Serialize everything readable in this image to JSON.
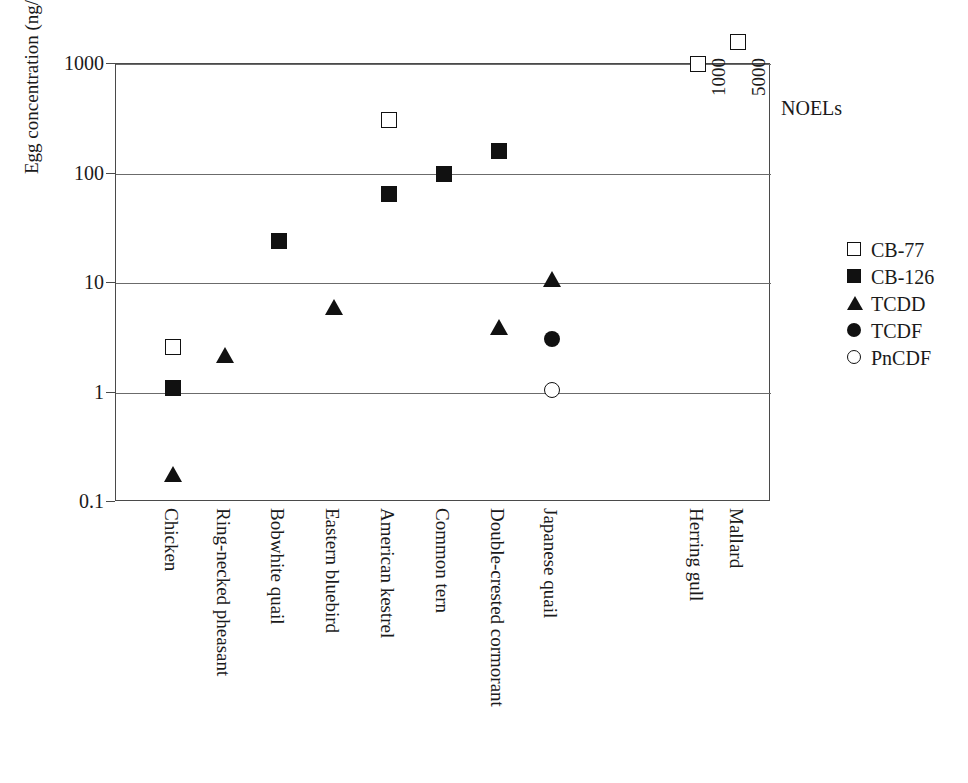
{
  "chart_data": {
    "type": "scatter",
    "title": "",
    "xlabel": "",
    "ylabel": "Egg concentration (ng/g ww)",
    "yscale": "log",
    "ylim": [
      0.1,
      1000
    ],
    "ytick_labels": [
      "1000",
      "100",
      "10",
      "1",
      "0.1"
    ],
    "ytick_values": [
      1000,
      100,
      10,
      1,
      0.1
    ],
    "grid": "horizontal",
    "legend_position": "right",
    "categories": [
      "Chicken",
      "Ring-necked pheasant",
      "Bobwhite quail",
      "Eastern bluebird",
      "American kestrel",
      "Common tern",
      "Double-crested cormorant",
      "Japanese quail",
      "",
      "Herring gull",
      "Mallard"
    ],
    "series": [
      {
        "name": "CB-77",
        "marker": "square-open",
        "points": [
          {
            "category": "Chicken",
            "value": 2.6
          },
          {
            "category": "American kestrel",
            "value": 310
          },
          {
            "category": "Herring gull",
            "value": 1000
          },
          {
            "category": "Mallard",
            "value": 1600
          }
        ]
      },
      {
        "name": "CB-126",
        "marker": "square-filled",
        "points": [
          {
            "category": "Chicken",
            "value": 1.1
          },
          {
            "category": "Bobwhite quail",
            "value": 24
          },
          {
            "category": "American kestrel",
            "value": 65
          },
          {
            "category": "Common tern",
            "value": 100
          },
          {
            "category": "Double-crested cormorant",
            "value": 160
          }
        ]
      },
      {
        "name": "TCDD",
        "marker": "triangle-filled",
        "points": [
          {
            "category": "Chicken",
            "value": 0.18
          },
          {
            "category": "Ring-necked pheasant",
            "value": 2.2
          },
          {
            "category": "Eastern bluebird",
            "value": 6.0
          },
          {
            "category": "Double-crested cormorant",
            "value": 4.0
          },
          {
            "category": "Japanese quail",
            "value": 10.8
          }
        ]
      },
      {
        "name": "TCDF",
        "marker": "circle-filled",
        "points": [
          {
            "category": "Japanese quail",
            "value": 3.1
          }
        ]
      },
      {
        "name": "PnCDF",
        "marker": "circle-open",
        "points": [
          {
            "category": "Japanese quail",
            "value": 1.05
          }
        ]
      }
    ],
    "annotations": [
      {
        "name": "noel-title",
        "text": "NOELs"
      },
      {
        "name": "noel-herring-gull",
        "text": "1000"
      },
      {
        "name": "noel-mallard",
        "text": "5000"
      }
    ]
  },
  "axis": {
    "y_title": "Egg concentration (ng/g ww)",
    "y_ticks": [
      {
        "label": "1000",
        "value": 1000
      },
      {
        "label": "100",
        "value": 100
      },
      {
        "label": "10",
        "value": 10
      },
      {
        "label": "1",
        "value": 1
      },
      {
        "label": "0.1",
        "value": 0.1
      }
    ]
  },
  "x_categories": [
    {
      "label": "Chicken",
      "x": 172
    },
    {
      "label": "Ring-necked pheasant",
      "x": 224
    },
    {
      "label": "Bobwhite quail",
      "x": 278
    },
    {
      "label": "Eastern bluebird",
      "x": 333
    },
    {
      "label": "American kestrel",
      "x": 388
    },
    {
      "label": "Common tern",
      "x": 443
    },
    {
      "label": "Double-crested cormorant",
      "x": 498
    },
    {
      "label": "Japanese quail",
      "x": 551
    },
    {
      "label": "Herring gull",
      "x": 697
    },
    {
      "label": "Mallard",
      "x": 737
    }
  ],
  "noels": {
    "title": "NOELs",
    "herring_gull": "1000",
    "mallard": "5000"
  },
  "legend": {
    "items": [
      {
        "label": "CB-77",
        "marker": "square-open"
      },
      {
        "label": "CB-126",
        "marker": "square-filled"
      },
      {
        "label": "TCDD",
        "marker": "triangle-filled"
      },
      {
        "label": "TCDF",
        "marker": "circle-filled"
      },
      {
        "label": "PnCDF",
        "marker": "circle-open"
      }
    ]
  }
}
